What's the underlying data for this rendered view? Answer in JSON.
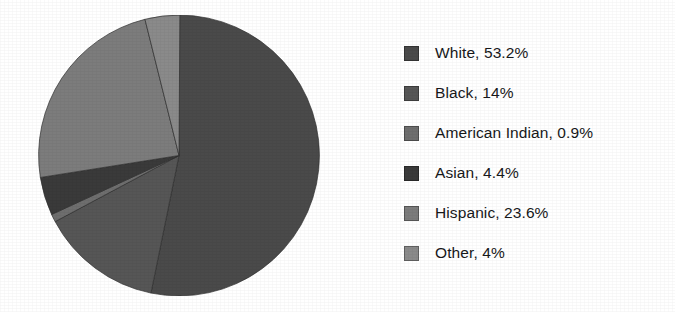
{
  "chart_data": {
    "type": "pie",
    "title": "",
    "subtitle": "",
    "xlabel": "",
    "ylabel": "",
    "legend_position": "right",
    "grid": false,
    "start_angle_deg": 0,
    "direction": "clockwise",
    "units": "percent",
    "categories": [
      "White",
      "Black",
      "American Indian",
      "Asian",
      "Hispanic",
      "Other"
    ],
    "values": [
      53.2,
      14,
      0.9,
      4.4,
      23.6,
      4
    ],
    "value_labels": [
      "53.2%",
      "14%",
      "0.9%",
      "4.4%",
      "23.6%",
      "4%"
    ],
    "colors": [
      "#4a4a4a",
      "#565656",
      "#6e6e6e",
      "#3a3a3a",
      "#7c7c7c",
      "#8a8a8a"
    ],
    "slices": [
      {
        "label": "White",
        "value": 53.2,
        "value_label": "53.2%",
        "legend_text": "White, 53.2%",
        "color": "#4a4a4a",
        "start_deg": 0,
        "sweep_deg": 191.52
      },
      {
        "label": "Black",
        "value": 14,
        "value_label": "14%",
        "legend_text": "Black, 14%",
        "color": "#565656",
        "start_deg": 191.52,
        "sweep_deg": 50.4
      },
      {
        "label": "American Indian",
        "value": 0.9,
        "value_label": "0.9%",
        "legend_text": "American Indian, 0.9%",
        "color": "#6e6e6e",
        "start_deg": 241.92,
        "sweep_deg": 3.24
      },
      {
        "label": "Asian",
        "value": 4.4,
        "value_label": "4.4%",
        "legend_text": "Asian, 4.4%",
        "color": "#3a3a3a",
        "start_deg": 245.16,
        "sweep_deg": 15.84
      },
      {
        "label": "Hispanic",
        "value": 23.6,
        "value_label": "23.6%",
        "legend_text": "Hispanic, 23.6%",
        "color": "#7c7c7c",
        "start_deg": 261.0,
        "sweep_deg": 84.96
      },
      {
        "label": "Other",
        "value": 4,
        "value_label": "4%",
        "legend_text": "Other, 4%",
        "color": "#8a8a8a",
        "start_deg": 345.96,
        "sweep_deg": 14.4
      }
    ]
  },
  "legend": {
    "items": [
      {
        "text": "White, 53.2%",
        "color": "#4a4a4a"
      },
      {
        "text": "Black, 14%",
        "color": "#565656"
      },
      {
        "text": "American Indian, 0.9%",
        "color": "#6e6e6e"
      },
      {
        "text": "Asian, 4.4%",
        "color": "#3a3a3a"
      },
      {
        "text": "Hispanic, 23.6%",
        "color": "#7c7c7c"
      },
      {
        "text": "Other, 4%",
        "color": "#8a8a8a"
      }
    ]
  }
}
